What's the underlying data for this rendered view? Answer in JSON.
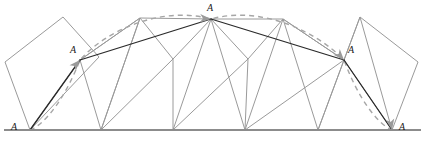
{
  "figure": {
    "colors": {
      "polygon_stroke": "#9a9a9a",
      "baseline_stroke": "#8c8c8c",
      "trace_stroke": "#a6a6a6",
      "chord_stroke": "#2a2a2a",
      "arrowhead_fill": "#9a9a9a",
      "background": "#ffffff",
      "label_color": "#1a1a1a"
    },
    "baseline": {
      "name": "ground-line",
      "x1": 4,
      "y1": 130,
      "x2": 421,
      "y2": 130
    },
    "contact_points_x": [
      30,
      101,
      173,
      245,
      318,
      392
    ],
    "vertex_labels": [
      {
        "id": "a-left-bottom",
        "text": "A",
        "x": 11,
        "y": 122,
        "vx": 30,
        "vy": 130
      },
      {
        "id": "a-left-upper",
        "text": "A",
        "x": 70,
        "y": 45,
        "vx": 80,
        "vy": 60
      },
      {
        "id": "a-apex",
        "text": "A",
        "x": 207,
        "y": 3,
        "vx": 211,
        "vy": 19
      },
      {
        "id": "a-right-upper",
        "text": "A",
        "x": 348,
        "y": 45,
        "vx": 344,
        "vy": 60
      },
      {
        "id": "a-right-bottom",
        "text": "A",
        "x": 399,
        "y": 122,
        "vx": 395,
        "vy": 130
      }
    ],
    "polygons": [
      {
        "id": "kite-position-1",
        "points": "30,130 5,62 63,17 99,57 30,130"
      },
      {
        "id": "kite-position-2",
        "points": "30,130 80,60 140,18 101,130 30,130"
      },
      {
        "id": "kite-position-3",
        "points": "101,130 80,60 140,18 173,59 101,130"
      },
      {
        "id": "kite-position-4",
        "points": "101,130 140,18 211,19 173,130 101,130"
      },
      {
        "id": "kite-position-5",
        "points": "173,130 173,59 211,19 248,59 173,130"
      },
      {
        "id": "kite-position-6",
        "points": "245,130 211,19 283,19 245,130"
      },
      {
        "id": "kite-position-7",
        "points": "245,130 248,59 283,19 344,60 245,130"
      },
      {
        "id": "kite-position-8",
        "points": "318,130 283,19 344,60 318,130"
      },
      {
        "id": "kite-position-9",
        "points": "318,130 344,60 360,17 392,130 318,130"
      },
      {
        "id": "kite-position-10",
        "points": "392,130 344,60 360,17 418,62 392,130"
      }
    ],
    "trace_curve": {
      "id": "locus-of-a",
      "style": "dashed",
      "path": "M 30,130 C 46,124 66,96 80,60 C 104,32 160,5 211,19 C 262,5 317,32 344,60 C 357,96 377,124 392,130"
    },
    "arrows": [
      {
        "id": "arrow-to-a-left-upper",
        "x": 80,
        "y": 60,
        "angle": -48
      },
      {
        "id": "arrow-to-a-apex",
        "x": 211,
        "y": 19,
        "angle": 4
      },
      {
        "id": "arrow-to-a-right-upper",
        "x": 344,
        "y": 60,
        "angle": 48
      },
      {
        "id": "arrow-to-a-right-bottom",
        "x": 392,
        "y": 130,
        "angle": 80
      }
    ],
    "chords": [
      {
        "id": "chord-bottom-left-to-upper-left",
        "x1": 30,
        "y1": 130,
        "x2": 80,
        "y2": 60
      },
      {
        "id": "chord-upper-left-to-apex",
        "x1": 80,
        "y1": 60,
        "x2": 211,
        "y2": 19
      },
      {
        "id": "chord-apex-to-upper-right",
        "x1": 211,
        "y1": 19,
        "x2": 344,
        "y2": 60
      },
      {
        "id": "chord-upper-right-to-bottom-right",
        "x1": 344,
        "y1": 60,
        "x2": 392,
        "y2": 130
      }
    ]
  }
}
